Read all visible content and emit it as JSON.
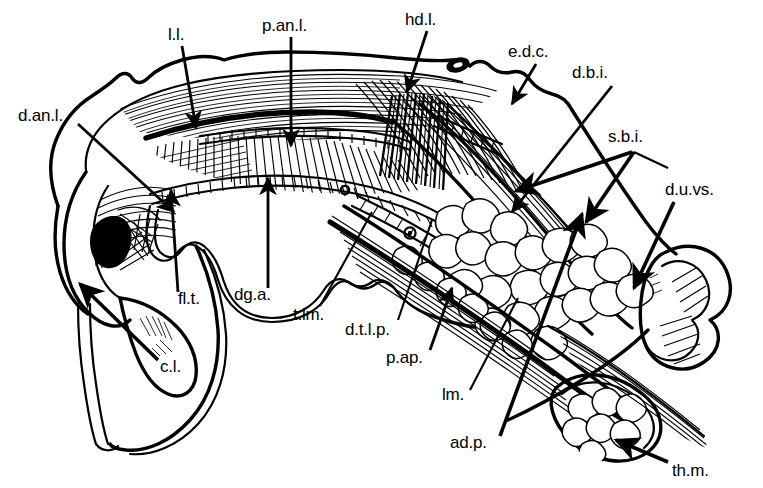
{
  "figure": {
    "kind": "anatomical-line-drawing",
    "background_color": "#ffffff",
    "ink_color": "#000000",
    "width": 763,
    "height": 488
  },
  "labels": [
    {
      "id": "l-l",
      "text": "l.l.",
      "x": 168,
      "y": 40,
      "anchor": "start"
    },
    {
      "id": "p-an-l",
      "text": "p.an.l.",
      "x": 262,
      "y": 31,
      "anchor": "start"
    },
    {
      "id": "hd-l",
      "text": "hd.l.",
      "x": 405,
      "y": 25,
      "anchor": "start"
    },
    {
      "id": "e-d-c",
      "text": "e.d.c.",
      "x": 508,
      "y": 57,
      "anchor": "start"
    },
    {
      "id": "d-b-i",
      "text": "d.b.i.",
      "x": 572,
      "y": 78,
      "anchor": "start"
    },
    {
      "id": "s-b-i",
      "text": "s.b.i.",
      "x": 608,
      "y": 142,
      "anchor": "start"
    },
    {
      "id": "d-u-vs",
      "text": "d.u.vs.",
      "x": 665,
      "y": 195,
      "anchor": "start"
    },
    {
      "id": "d-an-l",
      "text": "d.an.l.",
      "x": 18,
      "y": 121,
      "anchor": "start"
    },
    {
      "id": "fl-t",
      "text": "fl.t.",
      "x": 178,
      "y": 304,
      "anchor": "start"
    },
    {
      "id": "dg-a",
      "text": "dg.a.",
      "x": 234,
      "y": 300,
      "anchor": "start"
    },
    {
      "id": "t-lm",
      "text": "t.lm.",
      "x": 293,
      "y": 320,
      "anchor": "start"
    },
    {
      "id": "d-t-l-p",
      "text": "d.t.l.p.",
      "x": 345,
      "y": 335,
      "anchor": "start"
    },
    {
      "id": "p-ap",
      "text": "p.ap.",
      "x": 386,
      "y": 363,
      "anchor": "start"
    },
    {
      "id": "c-l",
      "text": "c.l.",
      "x": 160,
      "y": 372,
      "anchor": "start"
    },
    {
      "id": "lm",
      "text": "lm.",
      "x": 442,
      "y": 400,
      "anchor": "start"
    },
    {
      "id": "ad-p",
      "text": "ad.p.",
      "x": 450,
      "y": 448,
      "anchor": "start"
    },
    {
      "id": "th-m",
      "text": "th.m.",
      "x": 672,
      "y": 476,
      "anchor": "start"
    }
  ],
  "leaders": [
    {
      "id": "leader-l-l",
      "label": "l.l.",
      "points": "182,46 196,128",
      "arrow": true,
      "weight": "med"
    },
    {
      "id": "leader-p-an-l",
      "label": "p.an.l.",
      "points": "291,37 291,146",
      "arrow": true,
      "weight": "med"
    },
    {
      "id": "leader-hd-l",
      "label": "hd.l.",
      "points": "427,31 407,92",
      "arrow": true,
      "weight": "med"
    },
    {
      "id": "leader-e-d-c",
      "label": "e.d.c.",
      "points": "536,64 512,104",
      "arrow": true,
      "weight": "med"
    },
    {
      "id": "leader-d-b-i",
      "label": "d.b.i.",
      "points": "612,86 512,212",
      "arrow": true,
      "weight": "med"
    },
    {
      "id": "leader-s-b-i-a",
      "label": "s.b.i.",
      "points": "625,150 516,191",
      "arrow": true,
      "weight": "thick"
    },
    {
      "id": "leader-s-b-i-b",
      "label": "s.b.i.",
      "points": "628,150 586,220",
      "arrow": true,
      "weight": "thick"
    },
    {
      "id": "leader-d-u-vs",
      "label": "d.u.vs.",
      "points": "672,200 634,286",
      "arrow": true,
      "weight": "thick"
    },
    {
      "id": "leader-d-an-l",
      "label": "d.an.l.",
      "points": "78,124 174,212",
      "arrow": true,
      "weight": "med"
    },
    {
      "id": "leader-fl-t",
      "label": "fl.t.",
      "points": "178,292 172,190",
      "arrow": true,
      "weight": "med"
    },
    {
      "id": "leader-dg-a",
      "label": "dg.a.",
      "points": "268,288 268,178",
      "arrow": true,
      "weight": "med"
    },
    {
      "id": "leader-t-lm",
      "label": "t.lm.",
      "points": "320,304 372,214",
      "arrow": false,
      "weight": "thin"
    },
    {
      "id": "leader-d-t-l-p",
      "label": "d.t.l.p.",
      "points": "398,318 430,222",
      "arrow": false,
      "weight": "thin"
    },
    {
      "id": "leader-p-ap",
      "label": "p.ap.",
      "points": "430,348 452,288",
      "arrow": true,
      "weight": "med"
    },
    {
      "id": "leader-c-l",
      "label": "c.l.",
      "points": "158,360 80,284",
      "arrow": true,
      "weight": "thick"
    },
    {
      "id": "leader-lm",
      "label": "lm.",
      "points": "470,388 516,300",
      "arrow": false,
      "weight": "thin"
    },
    {
      "id": "leader-ad-p",
      "label": "ad.p.",
      "points": "500,434 582,214",
      "arrow": true,
      "weight": "thick"
    },
    {
      "id": "leader-th-m",
      "label": "th.m.",
      "points": "668,462 618,440",
      "arrow": true,
      "weight": "thick"
    }
  ],
  "legend_note": ""
}
